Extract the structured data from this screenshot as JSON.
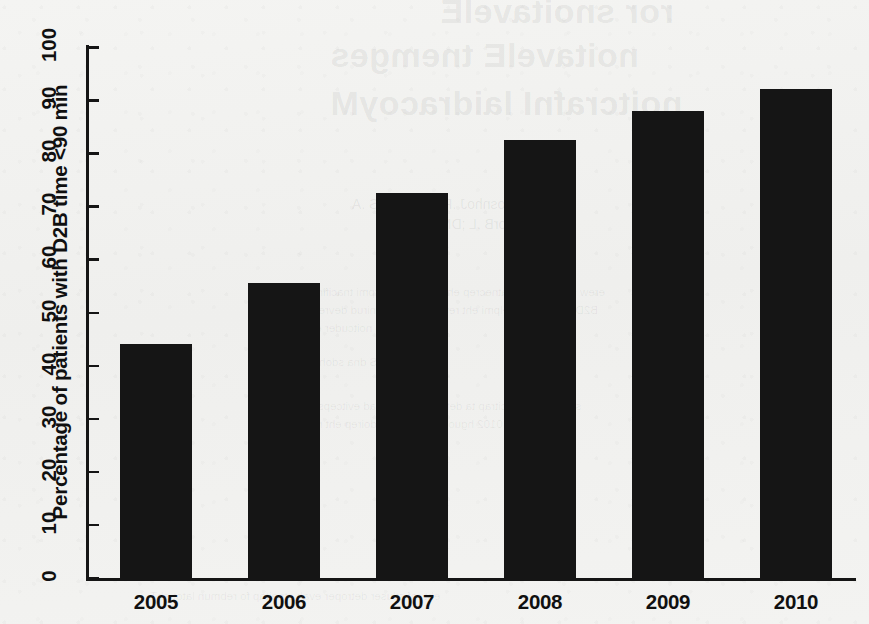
{
  "chart_data": {
    "type": "bar",
    "title": "",
    "xlabel": "",
    "ylabel": "Percentage of patients with D2B time <90 min",
    "categories": [
      "2005",
      "2006",
      "2007",
      "2008",
      "2009",
      "2010"
    ],
    "values": [
      44,
      55.5,
      72.5,
      82.5,
      88,
      92
    ],
    "ylim": [
      0,
      100
    ],
    "yticks": [
      0,
      10,
      20,
      30,
      40,
      50,
      60,
      70,
      80,
      90,
      100
    ],
    "ytick_labels": [
      "0",
      "10",
      "20",
      "30",
      "40",
      "50",
      "60",
      "70",
      "80",
      "90",
      "100"
    ],
    "grid": false,
    "legend": false,
    "bar_color": "#151515",
    "background_color": "#f2f2f0"
  },
  "showthrough": {
    "title_line1": "ror snoitavelE",
    "title_line2": "noitavelE tnemges",
    "title_line3": "noitcrafnI laidracoyM",
    "byline": "DM ,nosnhoJ .R ;DM ,htimS .A",
    "affil": "DM ,nworB .L ;DM ,seraC .J",
    "line1": "erew stneitap fo egatnecrep eht ni stnemevorpmi tnacifingiS",
    "line2": "B2D fo noitatnemelpmi eht retfa sraey eht gnirud devresbo",
    "line3": "margorp noitcuder emit",
    "line4": "seidutS dna sdohteM",
    "line5": "sretnec gnitapicitrap ta detcelloc erew atad evitcepsorP",
    "line6": "0102 hguorht 5002 morf doirep eht revo",
    "footer": "eht rof stluser detroper evah stneitap fo rebmun latot ehT"
  }
}
